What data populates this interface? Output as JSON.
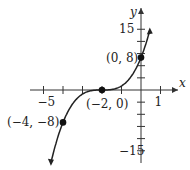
{
  "chart_data": {
    "type": "line",
    "title": "",
    "function": "y = (x + 2)^3",
    "xlabel": "x",
    "ylabel": "y",
    "xlim": [
      -5.5,
      1.5
    ],
    "ylim": [
      -18,
      18
    ],
    "x_tick_labels": [
      {
        "value": -5,
        "label": "−5"
      },
      {
        "value": 1,
        "label": "1"
      }
    ],
    "y_tick_labels": [
      {
        "value": 15,
        "label": "15"
      },
      {
        "value": -15,
        "label": "−15"
      }
    ],
    "x_ticks": [
      -5,
      -4,
      -3,
      -2,
      -1,
      0,
      1
    ],
    "y_ticks": [
      -15,
      -12,
      -9,
      -6,
      -3,
      3,
      6,
      9,
      12,
      15
    ],
    "points": [
      {
        "x": -4,
        "y": -8,
        "label": "(−4, −8)"
      },
      {
        "x": -2,
        "y": 0,
        "label": "(−2, 0)"
      },
      {
        "x": 0,
        "y": 8,
        "label": "(0, 8)"
      }
    ],
    "grid": false
  }
}
